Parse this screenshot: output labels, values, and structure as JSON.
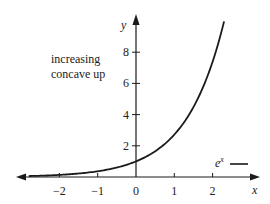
{
  "chart_data": {
    "type": "line",
    "title": "",
    "xlabel": "x",
    "ylabel": "y",
    "xlim": [
      -3,
      2.9
    ],
    "ylim": [
      0,
      10.2
    ],
    "x_ticks": [
      -2,
      -1,
      0,
      1,
      2
    ],
    "x_tick_labels": [
      "−2",
      "−1",
      "0",
      "1",
      "2"
    ],
    "y_ticks": [
      2,
      4,
      6,
      8
    ],
    "y_tick_labels": [
      "2",
      "4",
      "6",
      "8"
    ],
    "grid": false,
    "legend": {
      "position": "lower-right",
      "entries": [
        {
          "label": "e",
          "superscript": "x",
          "color": "#1a1a1a"
        }
      ]
    },
    "annotations": [
      "increasing",
      "concave up"
    ],
    "series": [
      {
        "name": "e^x",
        "function": "exp(x)",
        "color": "#1a1a1a",
        "x": [
          -2.8,
          -2.5,
          -2,
          -1.5,
          -1,
          -0.5,
          0,
          0.5,
          1,
          1.5,
          2,
          2.3
        ],
        "values": [
          0.06,
          0.08,
          0.14,
          0.22,
          0.37,
          0.61,
          1.0,
          1.65,
          2.72,
          4.48,
          7.39,
          9.97
        ]
      }
    ]
  }
}
